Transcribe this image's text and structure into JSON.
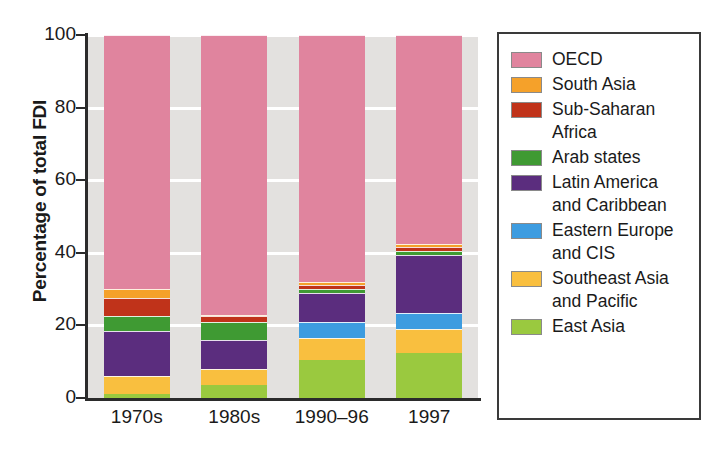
{
  "chart_data": {
    "type": "bar",
    "stacked": true,
    "title": "",
    "subtitle": "",
    "xlabel": "",
    "ylabel": "Percentage of total FDI",
    "categories": [
      "1970s",
      "1980s",
      "1990–96",
      "1997"
    ],
    "ylim": [
      0,
      100
    ],
    "ytick_labels": [
      "0",
      "20",
      "40",
      "60",
      "80",
      "100"
    ],
    "ytick_values": [
      0,
      20,
      40,
      60,
      80,
      100
    ],
    "grid": "horizontal",
    "legend_position": "right",
    "series": [
      {
        "name": "East Asia",
        "color": "#9ac93f",
        "values": [
          1.0,
          3.5,
          10.5,
          12.5
        ]
      },
      {
        "name": "Southeast Asia and Pacific",
        "color": "#f9bf3f",
        "values": [
          5.0,
          4.5,
          6.0,
          6.5
        ]
      },
      {
        "name": "Eastern Europe and CIS",
        "color": "#3d9ce0",
        "values": [
          0.0,
          0.0,
          4.5,
          4.5
        ]
      },
      {
        "name": "Latin America and Caribbean",
        "color": "#5b2d7e",
        "values": [
          12.5,
          8.0,
          8.0,
          16.0
        ]
      },
      {
        "name": "Arab states",
        "color": "#3f9a33",
        "values": [
          4.0,
          5.0,
          1.0,
          1.0
        ]
      },
      {
        "name": "Sub-Saharan Africa",
        "color": "#c0331a",
        "values": [
          5.0,
          1.5,
          1.0,
          1.0
        ]
      },
      {
        "name": "South Asia",
        "color": "#f5a12a",
        "values": [
          2.5,
          0.5,
          1.0,
          1.0
        ]
      },
      {
        "name": "OECD",
        "color": "#e0849e",
        "values": [
          70.0,
          77.0,
          68.0,
          57.5
        ]
      }
    ]
  },
  "axes": {
    "y_title": "Percentage of total FDI"
  },
  "legend": {
    "items": [
      {
        "label": "OECD",
        "color": "#e0849e",
        "icon": "color-swatch"
      },
      {
        "label": "South Asia",
        "color": "#f5a12a",
        "icon": "color-swatch"
      },
      {
        "label": "Sub-Saharan\nAfrica",
        "color": "#c0331a",
        "icon": "color-swatch"
      },
      {
        "label": "Arab states",
        "color": "#3f9a33",
        "icon": "color-swatch"
      },
      {
        "label": "Latin America\nand Caribbean",
        "color": "#5b2d7e",
        "icon": "color-swatch"
      },
      {
        "label": "Eastern Europe\nand CIS",
        "color": "#3d9ce0",
        "icon": "color-swatch"
      },
      {
        "label": "Southeast Asia\nand Pacific",
        "color": "#f9bf3f",
        "icon": "color-swatch"
      },
      {
        "label": "East Asia",
        "color": "#9ac93f",
        "icon": "color-swatch"
      }
    ]
  },
  "colors": {
    "plot_background": "#e3e1df",
    "gridline": "#ffffff",
    "axis": "#2b2b2b",
    "legend_border": "#3a3a3a"
  }
}
